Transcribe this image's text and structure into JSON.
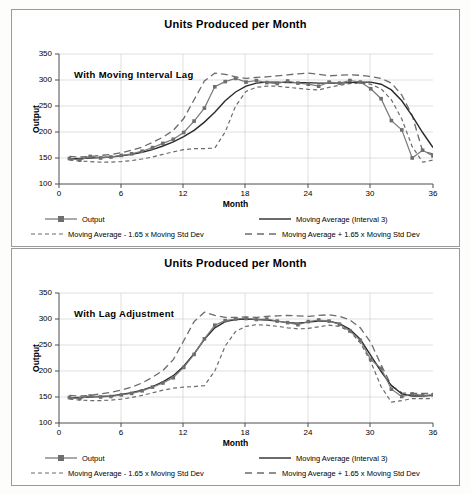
{
  "charts": [
    {
      "title": "Units Produced per Month",
      "annotation": "With Moving  Interval  Lag",
      "xlabel": "Month",
      "ylabel": "Output",
      "yticks": [
        "100",
        "150",
        "200",
        "250",
        "300",
        "350"
      ],
      "xticks": [
        "0",
        "6",
        "12",
        "18",
        "24",
        "30",
        "36"
      ],
      "legend": [
        "Output",
        "Moving Average (Interval 3)",
        "Moving Average - 1.65 x Moving Std Dev",
        "Moving Average + 1.65 x Moving Std Dev"
      ]
    },
    {
      "title": "Units Produced per Month",
      "annotation": "With Lag Adjustment",
      "xlabel": "Month",
      "ylabel": "Output",
      "yticks": [
        "100",
        "150",
        "200",
        "250",
        "300",
        "350"
      ],
      "xticks": [
        "0",
        "6",
        "12",
        "18",
        "24",
        "30",
        "36"
      ],
      "legend": [
        "Output",
        "Moving Average (Interval 3)",
        "Moving Average - 1.65 x Moving Std Dev",
        "Moving Average + 1.65 x Moving Std Dev"
      ]
    }
  ],
  "chart_data": [
    {
      "type": "line",
      "title": "Units Produced per Month",
      "annotation": "With Moving  Interval  Lag",
      "xlabel": "Month",
      "ylabel": "Output",
      "xlim": [
        0,
        36
      ],
      "ylim": [
        100,
        350
      ],
      "ytick_step": 50,
      "xtick_step": 6,
      "grid": true,
      "legend_position": "bottom",
      "colors": {
        "output": "#737373",
        "moving_average": "#333333",
        "lower_band": "#666666",
        "upper_band": "#666666"
      },
      "x": [
        1,
        2,
        3,
        4,
        5,
        6,
        7,
        8,
        9,
        10,
        11,
        12,
        13,
        14,
        15,
        16,
        17,
        18,
        19,
        20,
        21,
        22,
        23,
        24,
        25,
        26,
        27,
        28,
        29,
        30,
        31,
        32,
        33,
        34,
        35,
        36
      ],
      "series": [
        {
          "name": "Output",
          "style": "solid-markers",
          "values": [
            149,
            146,
            153,
            150,
            152,
            155,
            158,
            163,
            170,
            178,
            186,
            199,
            221,
            246,
            287,
            297,
            303,
            296,
            299,
            295,
            293,
            298,
            294,
            292,
            288,
            296,
            294,
            299,
            296,
            283,
            264,
            222,
            204,
            150,
            165,
            154
          ]
        },
        {
          "name": "Moving Average (Interval 3)",
          "style": "solid",
          "values": [
            148,
            149,
            150,
            151,
            152,
            154,
            157,
            161,
            166,
            173,
            181,
            191,
            203,
            219,
            238,
            260,
            277,
            288,
            294,
            296,
            296,
            295,
            295,
            295,
            294,
            294,
            294,
            295,
            296,
            296,
            292,
            281,
            260,
            231,
            199,
            170
          ]
        },
        {
          "name": "Moving Average - 1.65 x Moving Std Dev",
          "style": "dotted-dash",
          "values": [
            146,
            144,
            143,
            142,
            142,
            143,
            145,
            148,
            152,
            157,
            162,
            166,
            168,
            168,
            169,
            200,
            250,
            278,
            286,
            288,
            288,
            286,
            284,
            282,
            281,
            286,
            290,
            293,
            294,
            292,
            283,
            262,
            225,
            172,
            142,
            146
          ]
        },
        {
          "name": "Moving Average + 1.65 x Moving Std Dev",
          "style": "long-dash",
          "values": [
            153,
            152,
            153,
            155,
            157,
            160,
            165,
            171,
            180,
            190,
            203,
            226,
            262,
            298,
            313,
            311,
            306,
            303,
            305,
            306,
            308,
            310,
            312,
            313,
            311,
            308,
            309,
            310,
            309,
            307,
            303,
            294,
            271,
            232,
            163,
            158
          ]
        }
      ]
    },
    {
      "type": "line",
      "title": "Units Produced per Month",
      "annotation": "With Lag Adjustment",
      "xlabel": "Month",
      "ylabel": "Output",
      "xlim": [
        0,
        36
      ],
      "ylim": [
        100,
        350
      ],
      "ytick_step": 50,
      "xtick_step": 6,
      "grid": true,
      "legend_position": "bottom",
      "colors": {
        "output": "#737373",
        "moving_average": "#333333",
        "lower_band": "#666666",
        "upper_band": "#666666"
      },
      "x": [
        1,
        2,
        3,
        4,
        5,
        6,
        7,
        8,
        9,
        10,
        11,
        12,
        13,
        14,
        15,
        16,
        17,
        18,
        19,
        20,
        21,
        22,
        23,
        24,
        25,
        26,
        27,
        28,
        29,
        30,
        31,
        32,
        33,
        34,
        35,
        36
      ],
      "series": [
        {
          "name": "Output",
          "style": "solid-markers",
          "values": [
            149,
            147,
            152,
            150,
            151,
            154,
            157,
            162,
            169,
            177,
            187,
            207,
            232,
            262,
            288,
            297,
            300,
            301,
            299,
            300,
            296,
            293,
            289,
            295,
            298,
            296,
            290,
            277,
            259,
            222,
            205,
            165,
            151,
            156,
            153,
            154
          ]
        },
        {
          "name": "Moving Average (Interval 3)",
          "style": "solid",
          "values": [
            148,
            149,
            150,
            151,
            152,
            155,
            158,
            163,
            170,
            179,
            191,
            209,
            233,
            261,
            283,
            295,
            299,
            300,
            299,
            298,
            296,
            293,
            292,
            294,
            296,
            296,
            291,
            280,
            261,
            230,
            199,
            172,
            156,
            152,
            152,
            153
          ]
        },
        {
          "name": "Moving Average - 1.65 x Moving Std Dev",
          "style": "dotted-dash",
          "values": [
            146,
            144,
            143,
            143,
            144,
            146,
            149,
            153,
            158,
            163,
            167,
            169,
            170,
            172,
            200,
            248,
            276,
            286,
            289,
            288,
            286,
            283,
            281,
            282,
            285,
            288,
            286,
            276,
            254,
            218,
            170,
            140,
            143,
            147,
            147,
            147
          ]
        },
        {
          "name": "Moving Average + 1.65 x Moving Std Dev",
          "style": "long-dash",
          "values": [
            153,
            152,
            153,
            156,
            159,
            163,
            169,
            177,
            188,
            201,
            222,
            258,
            295,
            313,
            307,
            303,
            303,
            304,
            303,
            305,
            306,
            307,
            306,
            305,
            307,
            308,
            305,
            298,
            283,
            255,
            212,
            172,
            158,
            157,
            157,
            157
          ]
        }
      ]
    }
  ]
}
